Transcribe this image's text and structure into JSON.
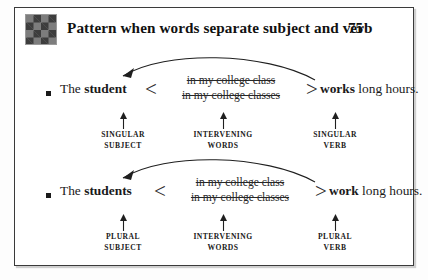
{
  "page": {
    "header": {
      "icon": "argyle-diamond-pattern-icon",
      "title": "Pattern when words separate subject and verb",
      "page_number": "75"
    },
    "blocks": [
      {
        "id": "singular",
        "bullet": "square-bullet",
        "subject_plain": "The ",
        "subject_bold": "student",
        "brace_open": "<",
        "brace_close": ">",
        "interveners": [
          "in my college class",
          "in my college classes"
        ],
        "predicate_bold": "works",
        "predicate_plain": " long hours.",
        "captions": [
          {
            "line1": "SINGULAR",
            "line2": "SUBJECT"
          },
          {
            "line1": "INTERVENING",
            "line2": "WORDS"
          },
          {
            "line1": "SINGULAR",
            "line2": "VERB"
          }
        ]
      },
      {
        "id": "plural",
        "bullet": "square-bullet",
        "subject_plain": "The ",
        "subject_bold": "students",
        "brace_open": "<",
        "brace_close": ">",
        "interveners": [
          "in my college class",
          "in my college classes"
        ],
        "predicate_bold": "work",
        "predicate_plain": " long hours.",
        "captions": [
          {
            "line1": "PLURAL",
            "line2": "SUBJECT"
          },
          {
            "line1": "INTERVENING",
            "line2": "WORDS"
          },
          {
            "line1": "PLURAL",
            "line2": "VERB"
          }
        ]
      }
    ],
    "colors": {
      "ink": "#1a1a1a",
      "frame": "#3a3a3a",
      "paper": "#ffffff",
      "icon_dark": "#3d3d3d",
      "icon_light": "#7d7d7d"
    }
  }
}
